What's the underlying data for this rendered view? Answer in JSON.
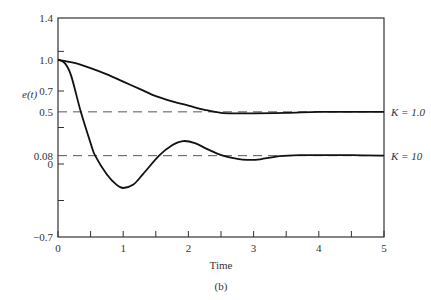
{
  "chart_data": {
    "type": "line",
    "title": "",
    "caption": "(b)",
    "xlabel": "Time",
    "ylabel": "e(t)",
    "xlim": [
      0,
      5
    ],
    "ylim": [
      -0.7,
      1.4
    ],
    "x_ticks": [
      0,
      1,
      2,
      3,
      4,
      5
    ],
    "x_tick_labels": [
      "0",
      "1",
      "2",
      "3",
      "4",
      "5"
    ],
    "x_minor_ticks": [
      0.5,
      1.5,
      2.5,
      3.5,
      4.5
    ],
    "y_tick_labels": [
      {
        "value": 1.4,
        "label": "1.4"
      },
      {
        "value": 1.0,
        "label": "1.0"
      },
      {
        "value": 0.7,
        "label": "0.7"
      },
      {
        "value": 0.5,
        "label": "0.5"
      },
      {
        "value": 0.08,
        "label": "0.08"
      },
      {
        "value": 0,
        "label": "0"
      },
      {
        "value": -0.7,
        "label": "−0.7"
      }
    ],
    "y_minor_ticks": [
      1.08,
      0.7,
      0.35,
      0,
      -0.35
    ],
    "grid": false,
    "reference_lines": [
      {
        "value": 0.5,
        "style": "dashed",
        "series": "K = 1.0"
      },
      {
        "value": 0.08,
        "style": "dashed",
        "series": "K = 10"
      }
    ],
    "series": [
      {
        "name": "K = 1.0",
        "label": "K = 1.0",
        "steady_state": 0.5,
        "x": [
          0,
          0.25,
          0.5,
          0.75,
          1.0,
          1.25,
          1.5,
          1.75,
          2.0,
          2.25,
          2.5,
          2.75,
          3.0,
          3.5,
          4.0,
          4.5,
          5.0
        ],
        "y": [
          1.0,
          0.97,
          0.92,
          0.86,
          0.79,
          0.72,
          0.65,
          0.6,
          0.56,
          0.52,
          0.49,
          0.485,
          0.485,
          0.49,
          0.5,
          0.5,
          0.5
        ]
      },
      {
        "name": "K = 10",
        "label": "K = 10",
        "steady_state": 0.08,
        "x": [
          0,
          0.1,
          0.2,
          0.35,
          0.5,
          0.57,
          0.75,
          0.9,
          1.0,
          1.15,
          1.3,
          1.55,
          1.75,
          1.92,
          2.1,
          2.3,
          2.53,
          2.75,
          2.9,
          3.1,
          3.4,
          3.75,
          4.0,
          4.5,
          5.0
        ],
        "y": [
          1.0,
          0.97,
          0.85,
          0.5,
          0.2,
          0.08,
          -0.1,
          -0.2,
          -0.23,
          -0.2,
          -0.1,
          0.08,
          0.18,
          0.22,
          0.2,
          0.14,
          0.08,
          0.05,
          0.04,
          0.045,
          0.075,
          0.085,
          0.085,
          0.085,
          0.08
        ]
      }
    ]
  }
}
